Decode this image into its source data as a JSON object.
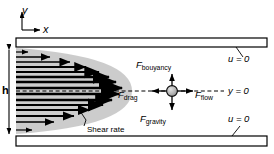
{
  "figure": {
    "type": "fluid-flow-diagram",
    "background_color": "#ffffff",
    "line_color": "#000000",
    "shade_color": "#c8c8c8",
    "particle_color": "#b0b0b0"
  },
  "axes": {
    "y_label": "y",
    "x_label": "x"
  },
  "channel": {
    "height_label": "h",
    "top_wall": {
      "boundary_label": "u = 0",
      "bc_variable": "u",
      "bc_value": "0"
    },
    "bottom_wall": {
      "boundary_label": "u = 0",
      "bc_variable": "u",
      "bc_value": "0"
    },
    "centerline": {
      "label": "y = 0",
      "variable": "y",
      "value": "0"
    }
  },
  "velocity_profile": {
    "shape": "parabolic",
    "annotation": "Shear rate",
    "arrow_count": 15,
    "arrow_lengths": [
      12,
      34,
      54,
      70,
      83,
      93,
      100,
      103,
      100,
      93,
      83,
      70,
      54,
      34,
      14
    ]
  },
  "particle": {
    "name": "suspended particle",
    "forces": [
      {
        "key": "bouyancy",
        "symbol": "F",
        "subscript": "bouyancy",
        "direction": "up"
      },
      {
        "key": "drag",
        "symbol": "F",
        "subscript": "drag",
        "direction": "left"
      },
      {
        "key": "flow",
        "symbol": "F",
        "subscript": "flow",
        "direction": "right"
      },
      {
        "key": "gravity",
        "symbol": "F",
        "subscript": "gravity",
        "direction": "down"
      }
    ]
  },
  "labels": {
    "axis_y": "y",
    "axis_x": "x",
    "height": "h",
    "shear_rate": "Shear rate",
    "u_top": "u = 0",
    "u_bottom": "u = 0",
    "y_zero": "y = 0",
    "f_symbol": "F",
    "f_bouyancy_sub": "bouyancy",
    "f_drag_sub": "drag",
    "f_flow_sub": "flow",
    "f_gravity_sub": "gravity"
  }
}
